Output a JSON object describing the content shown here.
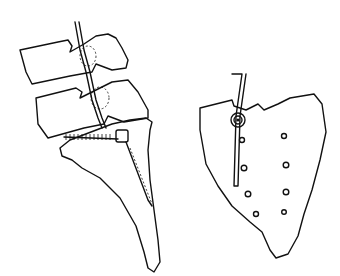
{
  "figure": {
    "panels": [
      {
        "name": "lateral-view",
        "elements": [
          "vertebra-l4",
          "vertebra-l5",
          "sacrum-lateral",
          "rod",
          "pedicle-screw"
        ]
      },
      {
        "name": "posterior-view",
        "elements": [
          "sacrum-posterior",
          "rod",
          "screw-head",
          "sacral-foramina"
        ]
      }
    ],
    "foramina_count": 8,
    "stroke_color": "#111111",
    "background": "#ffffff"
  }
}
